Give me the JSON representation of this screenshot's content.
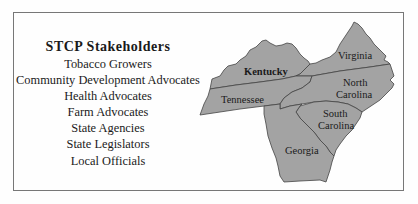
{
  "panel": {
    "title": "STCP Stakeholders",
    "stakeholders": [
      "Tobacco Growers",
      "Community Development Advocates",
      "Health Advocates",
      "Farm Advocates",
      "State Agencies",
      "State Legislators",
      "Local Officials"
    ]
  },
  "map": {
    "fill_color": "#a3a3a3",
    "border_color": "#444444",
    "states": [
      {
        "name": "Kentucky",
        "label_lines": [
          "Kentucky"
        ]
      },
      {
        "name": "Virginia",
        "label_lines": [
          "Virginia"
        ]
      },
      {
        "name": "Tennessee",
        "label_lines": [
          "Tennessee"
        ]
      },
      {
        "name": "North Carolina",
        "label_lines": [
          "North",
          "Carolina"
        ]
      },
      {
        "name": "South Carolina",
        "label_lines": [
          "South",
          "Carolina"
        ]
      },
      {
        "name": "Georgia",
        "label_lines": [
          "Georgia"
        ]
      }
    ]
  }
}
